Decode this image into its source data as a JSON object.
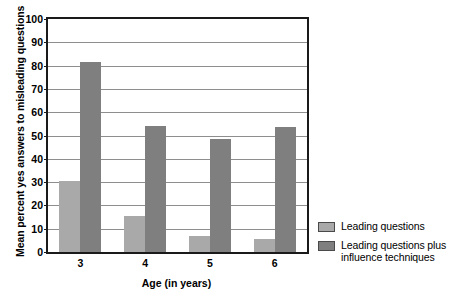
{
  "chart_data": {
    "type": "bar",
    "title": "",
    "xlabel": "Age (in years)",
    "ylabel": "Mean percent yes answers to misleading questions",
    "categories": [
      "3",
      "4",
      "5",
      "6"
    ],
    "ylim": [
      0,
      100
    ],
    "yticks": [
      0,
      10,
      20,
      30,
      40,
      50,
      60,
      70,
      80,
      90,
      100
    ],
    "ytick_labels": [
      "0",
      "10",
      "20",
      "30",
      "40",
      "50",
      "60",
      "70",
      "80",
      "90",
      "100"
    ],
    "grid": true,
    "legend_position": "right",
    "series": [
      {
        "name": "Leading questions",
        "color": "#a9a9a9",
        "values": [
          30.5,
          15.5,
          7,
          5.5
        ]
      },
      {
        "name": "Leading questions plus influence techniques",
        "color": "#7f7f7f",
        "values": [
          81.5,
          54,
          48.5,
          53.5
        ]
      }
    ]
  },
  "legend": {
    "entries": [
      {
        "label": "Leading questions",
        "swatch": "light-gray-swatch"
      },
      {
        "label": "Leading questions plus influence techniques",
        "swatch": "dark-gray-swatch"
      }
    ]
  },
  "colors": {
    "series_light": "#a9a9a9",
    "series_dark": "#7f7f7f",
    "axis": "#1a1a1a",
    "gridline": "#8e8e8e",
    "background": "#ffffff"
  }
}
